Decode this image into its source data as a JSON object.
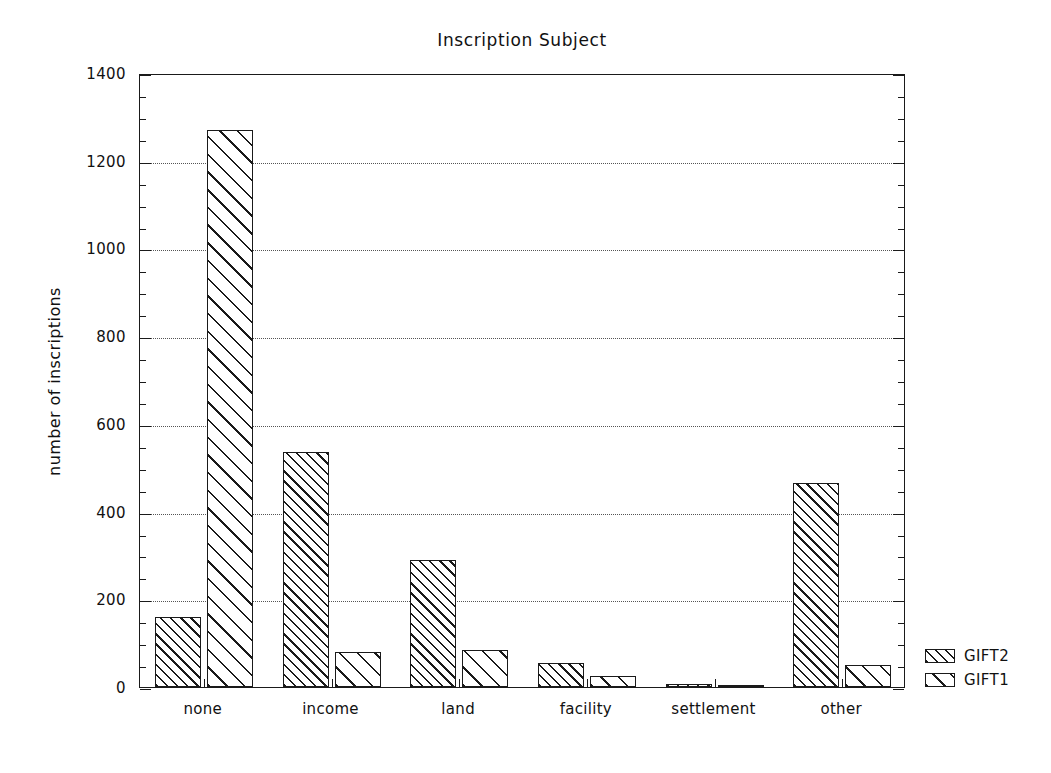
{
  "chart_data": {
    "type": "bar",
    "title": "Inscription Subject",
    "xlabel": "",
    "ylabel": "number of inscriptions",
    "categories": [
      "none",
      "income",
      "land",
      "facility",
      "settlement",
      "other"
    ],
    "series": [
      {
        "name": "GIFT2",
        "values": [
          160,
          535,
          290,
          55,
          8,
          465
        ],
        "hatch": "dense-diagonal"
      },
      {
        "name": "GIFT1",
        "values": [
          1270,
          80,
          85,
          25,
          3,
          50
        ],
        "hatch": "wide-diagonal"
      }
    ],
    "ylim": [
      0,
      1400
    ],
    "y_ticks": [
      0,
      200,
      400,
      600,
      800,
      1000,
      1200,
      1400
    ],
    "y_tick_labels": [
      "0",
      "200",
      "400",
      "600",
      "800",
      "1000",
      "1200",
      "1400"
    ],
    "y_minor_tick_interval": 50,
    "grid": true,
    "grid_style": "dotted",
    "grid_axis": "y",
    "legend_position": "right-outside",
    "legend_entries": [
      "GIFT2",
      "GIFT1"
    ],
    "colors": {
      "line": "#1a1a1a",
      "fill": "#ffffff",
      "grid": "#555555",
      "background": "#ffffff"
    }
  }
}
